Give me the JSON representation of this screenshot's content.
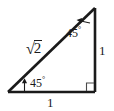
{
  "figure": {
    "name": "45-45-90 right triangle",
    "stroke_color": "#1a1a1a",
    "background_color": "#ffffff",
    "labels": {
      "hypotenuse": {
        "radical_sign": "√",
        "radicand": "2",
        "full": "√2"
      },
      "vertical_leg": "1",
      "horizontal_leg": "1",
      "angle_top": {
        "value": "45",
        "degree": "°"
      },
      "angle_bottom_left": {
        "value": "45",
        "degree": "°"
      }
    },
    "markers": {
      "right_angle": "right-angle-square",
      "angle_top_pointer": "arrow-left",
      "angle_bottom_pointer": "arrow-up"
    },
    "geometry": {
      "vertex_bottom_left": "8,92",
      "vertex_bottom_right": "95,92",
      "vertex_top_right": "95,8"
    }
  }
}
